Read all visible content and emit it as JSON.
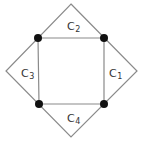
{
  "diagram": {
    "colors": {
      "line": "#8a8a8a",
      "dot": "#111111",
      "background": "#ffffff",
      "label": "#333333"
    },
    "inner_square": {
      "corners": [
        {
          "name": "top-left",
          "x": 38,
          "y": 38
        },
        {
          "name": "top-right",
          "x": 104,
          "y": 38
        },
        {
          "name": "bottom-right",
          "x": 104,
          "y": 104
        },
        {
          "name": "bottom-left",
          "x": 39,
          "y": 104
        }
      ]
    },
    "outer_diamond": {
      "vertices": [
        {
          "name": "top",
          "x": 71,
          "y": 4
        },
        {
          "name": "right",
          "x": 137,
          "y": 71
        },
        {
          "name": "bottom",
          "x": 71,
          "y": 137
        },
        {
          "name": "left",
          "x": 6,
          "y": 71
        }
      ]
    },
    "regions": [
      {
        "id": "c1",
        "base": "C",
        "sub": "1",
        "x": 109,
        "y": 77,
        "position": "right"
      },
      {
        "id": "c2",
        "base": "C",
        "sub": "2",
        "x": 67,
        "y": 30,
        "position": "top"
      },
      {
        "id": "c3",
        "base": "C",
        "sub": "3",
        "x": 21,
        "y": 77,
        "position": "left"
      },
      {
        "id": "c4",
        "base": "C",
        "sub": "4",
        "x": 67,
        "y": 122,
        "position": "bottom"
      }
    ]
  }
}
